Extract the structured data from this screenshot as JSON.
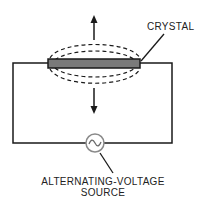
{
  "diagram": {
    "labels": {
      "crystal": "CRYSTAL",
      "source_line1": "ALTERNATING-VOLTAGE",
      "source_line2": "SOURCE"
    },
    "colors": {
      "line": "#1a1a1a",
      "crystal_fill": "#7a7a7a",
      "source_circle": "#8a8a8a"
    },
    "icons": {
      "source_symbol": "~"
    }
  }
}
